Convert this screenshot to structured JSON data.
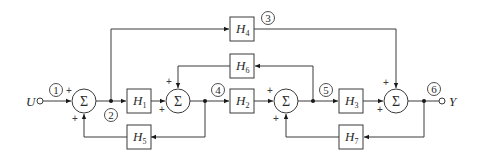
{
  "diagram": {
    "input": {
      "label": "U",
      "node": "1"
    },
    "output": {
      "label": "Y",
      "node": "6"
    },
    "blocks": [
      {
        "id": "H1",
        "letter": "H",
        "sub": "1"
      },
      {
        "id": "H2",
        "letter": "H",
        "sub": "2"
      },
      {
        "id": "H3",
        "letter": "H",
        "sub": "3"
      },
      {
        "id": "H4",
        "letter": "H",
        "sub": "4"
      },
      {
        "id": "H5",
        "letter": "H",
        "sub": "5"
      },
      {
        "id": "H6",
        "letter": "H",
        "sub": "6"
      },
      {
        "id": "H7",
        "letter": "H",
        "sub": "7"
      }
    ],
    "summing_junctions": [
      {
        "id": "S1",
        "symbol": "Σ",
        "signs": [
          "+",
          "+"
        ]
      },
      {
        "id": "S2",
        "symbol": "Σ",
        "signs": [
          "+",
          "+"
        ]
      },
      {
        "id": "S3",
        "symbol": "Σ",
        "signs": [
          "+",
          "+"
        ]
      },
      {
        "id": "S4",
        "symbol": "Σ",
        "signs": [
          "+",
          "+"
        ]
      }
    ],
    "node_labels": [
      "1",
      "2",
      "3",
      "4",
      "5",
      "6"
    ],
    "connections": [
      "U -> S1 (+)",
      "S1 -> node2",
      "node2 -> H1 -> S2 (+)",
      "node2 -> H4 -> S4 (+)",
      "S2 -> node4",
      "node4 -> H5 -> S1 (+)",
      "node4 -> H2 -> S3 (+)",
      "S3 -> node5",
      "node5 -> H6 -> S2 (+)",
      "node5 -> H3 -> S4 (+)",
      "S4 -> node6 -> Y",
      "node6 -> H7 -> S3 (+)"
    ],
    "plus": "+"
  }
}
